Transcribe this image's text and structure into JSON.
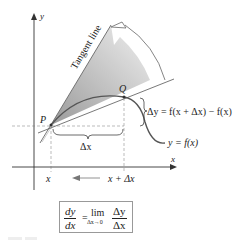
{
  "figure": {
    "labels": {
      "y_axis": "y",
      "x_axis": "x",
      "tangent_line": "Tangent line",
      "point_p": "P",
      "point_q": "Q",
      "delta_y_eq": "Δy = f(x + Δx) − f(x)",
      "curve": "y = f(x)",
      "delta_x": "Δx",
      "x_tick": "x",
      "x_plus_dx_tick": "x + Δx"
    },
    "formula": {
      "dy": "dy",
      "dx": "dx",
      "equals": "=",
      "lim": "lim",
      "lim_sub": "Δx→0",
      "delta_y": "Δy",
      "delta_x": "Δx"
    },
    "colors": {
      "curve": "#555555",
      "axis": "#333333",
      "shade_dark": "#9a9a9a",
      "shade_light": "#f2f2f2"
    }
  }
}
